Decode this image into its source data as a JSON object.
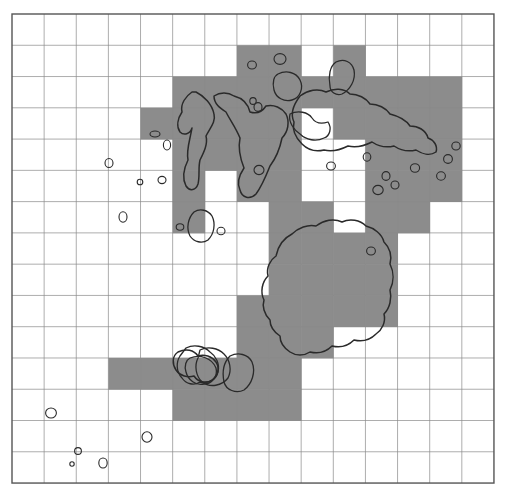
{
  "figure": {
    "type": "grid-coverage-map",
    "title": "",
    "canvas": {
      "width": 505,
      "height": 495
    },
    "colors": {
      "background": "#ffffff",
      "shaded_cell": "#8c8c8c",
      "grid_line": "#8a8a8a",
      "border": "#555555",
      "contour_stroke": "#2a2a2a",
      "contour_fill": "none"
    }
  },
  "grid": {
    "columns": 15,
    "rows": 15,
    "origin_x": 12,
    "origin_y": 14,
    "cell_width": 32.13,
    "cell_height": 31.27,
    "border_width": 1.4,
    "line_width": 0.7,
    "visible": true,
    "labels": {
      "x_ticks": [],
      "y_ticks": []
    }
  },
  "chart_data": {
    "type": "heatmap",
    "title": "",
    "xlabel": "",
    "ylabel": "",
    "legend": [],
    "grid": true,
    "columns": 15,
    "rows": 15,
    "value_legend": {
      "0": "unshaded",
      "1": "shaded"
    },
    "shaded_cells": [
      [
        7,
        1
      ],
      [
        8,
        1
      ],
      [
        10,
        1
      ],
      [
        5,
        2
      ],
      [
        6,
        2
      ],
      [
        7,
        2
      ],
      [
        8,
        2
      ],
      [
        9,
        2
      ],
      [
        10,
        2
      ],
      [
        11,
        2
      ],
      [
        12,
        2
      ],
      [
        13,
        2
      ],
      [
        4,
        3
      ],
      [
        5,
        3
      ],
      [
        6,
        3
      ],
      [
        7,
        3
      ],
      [
        8,
        3
      ],
      [
        10,
        3
      ],
      [
        11,
        3
      ],
      [
        12,
        3
      ],
      [
        13,
        3
      ],
      [
        5,
        4
      ],
      [
        6,
        4
      ],
      [
        7,
        4
      ],
      [
        8,
        4
      ],
      [
        11,
        4
      ],
      [
        12,
        4
      ],
      [
        13,
        4
      ],
      [
        5,
        5
      ],
      [
        7,
        5
      ],
      [
        8,
        5
      ],
      [
        11,
        5
      ],
      [
        12,
        5
      ],
      [
        13,
        5
      ],
      [
        5,
        6
      ],
      [
        8,
        6
      ],
      [
        9,
        6
      ],
      [
        11,
        6
      ],
      [
        12,
        6
      ],
      [
        8,
        7
      ],
      [
        9,
        7
      ],
      [
        10,
        7
      ],
      [
        11,
        7
      ],
      [
        8,
        8
      ],
      [
        9,
        8
      ],
      [
        10,
        8
      ],
      [
        11,
        8
      ],
      [
        7,
        9
      ],
      [
        8,
        9
      ],
      [
        9,
        9
      ],
      [
        10,
        9
      ],
      [
        11,
        9
      ],
      [
        7,
        10
      ],
      [
        8,
        10
      ],
      [
        9,
        10
      ],
      [
        3,
        11
      ],
      [
        4,
        11
      ],
      [
        5,
        11
      ],
      [
        6,
        11
      ],
      [
        7,
        11
      ],
      [
        8,
        11
      ],
      [
        5,
        12
      ],
      [
        6,
        12
      ],
      [
        7,
        12
      ],
      [
        8,
        12
      ]
    ],
    "matrix": [
      [
        0,
        0,
        0,
        0,
        0,
        0,
        0,
        0,
        0,
        0,
        0,
        0,
        0,
        0,
        0
      ],
      [
        0,
        0,
        0,
        0,
        0,
        0,
        0,
        1,
        1,
        0,
        1,
        0,
        0,
        0,
        0
      ],
      [
        0,
        0,
        0,
        0,
        0,
        1,
        1,
        1,
        1,
        1,
        1,
        1,
        1,
        1,
        0
      ],
      [
        0,
        0,
        0,
        0,
        1,
        1,
        1,
        1,
        1,
        0,
        1,
        1,
        1,
        1,
        0
      ],
      [
        0,
        0,
        0,
        0,
        0,
        1,
        1,
        1,
        1,
        0,
        0,
        1,
        1,
        1,
        0
      ],
      [
        0,
        0,
        0,
        0,
        0,
        1,
        0,
        1,
        1,
        0,
        0,
        1,
        1,
        1,
        0
      ],
      [
        0,
        0,
        0,
        0,
        0,
        1,
        0,
        0,
        1,
        1,
        0,
        1,
        1,
        0,
        0
      ],
      [
        0,
        0,
        0,
        0,
        0,
        0,
        0,
        0,
        1,
        1,
        1,
        1,
        0,
        0,
        0
      ],
      [
        0,
        0,
        0,
        0,
        0,
        0,
        0,
        0,
        1,
        1,
        1,
        1,
        0,
        0,
        0
      ],
      [
        0,
        0,
        0,
        0,
        0,
        0,
        0,
        1,
        1,
        1,
        1,
        1,
        0,
        0,
        0
      ],
      [
        0,
        0,
        0,
        0,
        0,
        0,
        0,
        1,
        1,
        1,
        0,
        0,
        0,
        0,
        0
      ],
      [
        0,
        0,
        0,
        1,
        1,
        1,
        1,
        1,
        1,
        0,
        0,
        0,
        0,
        0,
        0
      ],
      [
        0,
        0,
        0,
        0,
        0,
        1,
        1,
        1,
        1,
        0,
        0,
        0,
        0,
        0,
        0
      ],
      [
        0,
        0,
        0,
        0,
        0,
        0,
        0,
        0,
        0,
        0,
        0,
        0,
        0,
        0,
        0
      ],
      [
        0,
        0,
        0,
        0,
        0,
        0,
        0,
        0,
        0,
        0,
        0,
        0,
        0,
        0,
        0
      ]
    ],
    "shaded_count": 64,
    "total_cells": 225
  },
  "contours": {
    "count_large": 5,
    "count_small_islets": 28,
    "stroke_color": "#2a2a2a",
    "large_outlines": [
      "M192,92 C186,96 180,104 182,112 C178,118 176,126 180,132 C184,136 190,134 192,128 C190,140 186,150 188,160 C184,168 182,178 186,186 C190,192 196,190 198,184 C200,176 198,168 200,160 C204,152 208,144 206,136 C210,128 216,122 214,114 C212,104 204,96 196,92 Z",
      "M214,96 C220,92 228,92 234,96 C242,98 248,104 250,112 C256,114 262,112 266,106 C274,104 282,108 286,114 C290,122 288,132 282,138 C280,148 276,158 270,166 C266,176 262,186 256,194 C250,200 242,198 240,190 C236,182 240,174 244,168 C240,158 238,148 240,138 C236,128 230,120 226,112 C220,108 214,104 214,96 Z",
      "M300,96 C308,90 318,88 326,92 C334,88 344,88 350,94 C358,94 366,98 370,104 C378,104 386,108 390,114 C398,116 406,120 410,126 C418,126 426,130 428,138 C434,140 438,146 436,152 C430,156 422,154 416,150 C408,152 400,150 394,146 C386,148 378,146 372,142 C364,146 356,148 348,146 C340,150 332,152 324,150 C316,152 308,150 302,144 C296,138 292,130 294,122 C290,114 294,104 300,96 Z",
      "M316,226 C324,220 334,218 342,222 C350,218 360,220 366,226 C374,228 382,234 384,242 C390,248 392,256 390,264 C394,272 394,282 390,290 C392,298 390,308 384,314 C386,322 382,330 376,334 C370,340 362,342 354,340 C348,346 340,348 332,346 C326,352 318,354 310,352 C304,356 296,356 290,352 C284,348 280,342 280,336 C274,332 270,326 270,320 C264,314 262,306 264,300 C260,292 262,282 268,276 C266,268 270,260 276,256 C278,246 284,238 292,234 C298,228 308,224 316,226 Z",
      "M178,352 C186,348 194,350 198,356 C204,354 212,356 216,362 C220,368 218,376 212,380 C206,384 198,382 194,376 C188,378 180,376 176,370 C172,364 172,356 178,352 Z"
    ],
    "medium_outlines": [
      "M186,348 C194,344 204,346 210,352 C216,356 220,364 218,372 C216,380 208,384 200,382 C194,386 186,384 182,378 C176,372 176,362 180,356 Z",
      "M194,212 C200,208 208,210 212,216 C216,224 214,234 208,240 C202,244 194,242 190,236 C186,228 188,218 194,212 Z",
      "M278,74 C286,70 296,72 300,80 C304,88 300,98 292,100 C284,102 276,98 274,90 C272,82 274,76 278,74 Z",
      "M336,62 C344,58 352,62 354,70 C356,80 350,90 342,94 C336,96 330,92 330,86 C328,76 330,66 336,62 Z",
      "M290,114 C298,110 308,112 312,118 C316,124 322,124 328,122 C332,128 330,136 324,138 C316,142 306,140 300,134 C294,130 288,122 290,114 Z",
      "M190,358 C200,354 212,358 216,368 C218,376 212,384 204,384 C196,386 188,380 186,372 C184,366 186,360 190,358 Z",
      "M200,350 C208,346 218,348 224,354 C230,360 232,370 228,378 C222,386 210,388 202,382 C196,376 194,366 198,358 Z",
      "M230,356 C238,352 248,354 252,362 C256,372 252,384 244,390 C236,394 226,390 224,382 C222,372 224,362 230,356 Z"
    ],
    "islets": [
      {
        "cx": 109,
        "cy": 163,
        "rx": 4.0,
        "ry": 4.5
      },
      {
        "cx": 140,
        "cy": 182,
        "rx": 2.8,
        "ry": 2.8
      },
      {
        "cx": 162,
        "cy": 180,
        "rx": 4.0,
        "ry": 3.6
      },
      {
        "cx": 123,
        "cy": 217,
        "rx": 4.0,
        "ry": 5.2
      },
      {
        "cx": 180,
        "cy": 227,
        "rx": 3.8,
        "ry": 3.2
      },
      {
        "cx": 221,
        "cy": 231,
        "rx": 4.0,
        "ry": 3.8
      },
      {
        "cx": 155,
        "cy": 134,
        "rx": 5.0,
        "ry": 3.0
      },
      {
        "cx": 167,
        "cy": 145,
        "rx": 3.6,
        "ry": 5.0
      },
      {
        "cx": 252,
        "cy": 65,
        "rx": 4.4,
        "ry": 4.0
      },
      {
        "cx": 280,
        "cy": 59,
        "rx": 6.0,
        "ry": 5.4
      },
      {
        "cx": 258,
        "cy": 107,
        "rx": 4.0,
        "ry": 4.4
      },
      {
        "cx": 259,
        "cy": 170,
        "rx": 5.0,
        "ry": 4.6
      },
      {
        "cx": 331,
        "cy": 166,
        "rx": 4.4,
        "ry": 4.0
      },
      {
        "cx": 367,
        "cy": 157,
        "rx": 3.8,
        "ry": 4.2
      },
      {
        "cx": 378,
        "cy": 190,
        "rx": 5.2,
        "ry": 4.6
      },
      {
        "cx": 386,
        "cy": 176,
        "rx": 4.0,
        "ry": 4.4
      },
      {
        "cx": 395,
        "cy": 185,
        "rx": 4.0,
        "ry": 4.0
      },
      {
        "cx": 415,
        "cy": 168,
        "rx": 4.6,
        "ry": 4.2
      },
      {
        "cx": 441,
        "cy": 176,
        "rx": 4.4,
        "ry": 4.2
      },
      {
        "cx": 448,
        "cy": 159,
        "rx": 4.4,
        "ry": 4.4
      },
      {
        "cx": 456,
        "cy": 146,
        "rx": 4.2,
        "ry": 4.0
      },
      {
        "cx": 371,
        "cy": 251,
        "rx": 4.4,
        "ry": 4.0
      },
      {
        "cx": 51,
        "cy": 413,
        "rx": 5.4,
        "ry": 5.0
      },
      {
        "cx": 147,
        "cy": 437,
        "rx": 5.0,
        "ry": 5.2
      },
      {
        "cx": 78,
        "cy": 451,
        "rx": 3.4,
        "ry": 3.4
      },
      {
        "cx": 72,
        "cy": 464,
        "rx": 2.2,
        "ry": 2.2
      },
      {
        "cx": 103,
        "cy": 463,
        "rx": 4.2,
        "ry": 5.0
      },
      {
        "cx": 253,
        "cy": 101,
        "rx": 3.2,
        "ry": 3.4
      }
    ]
  }
}
